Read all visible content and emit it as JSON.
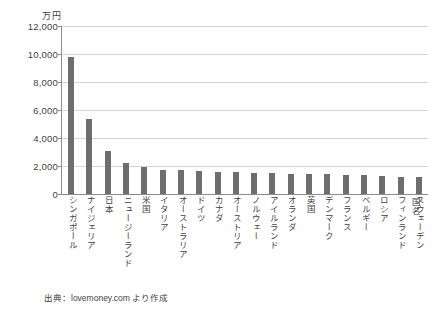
{
  "chart_data": {
    "type": "bar",
    "title": "",
    "subtitle": "",
    "xlabel": "国名",
    "ylabel": "万円",
    "ylim": [
      0,
      12000
    ],
    "ytick_labels": [
      "12,000",
      "10,000",
      "8,000",
      "6,000",
      "4,000",
      "2,000",
      "0"
    ],
    "ytick_values": [
      12000,
      10000,
      8000,
      6000,
      4000,
      2000,
      0
    ],
    "grid": true,
    "legend": "none",
    "bar_color": "#6e6e6e",
    "grid_color": "#d4d4d4",
    "axis_color": "#8c8c8c",
    "categories": [
      "シンガポール",
      "ナイジェリア",
      "日本",
      "ニュージーランド",
      "米国",
      "イタリア",
      "オーストラリア",
      "ドイツ",
      "カナダ",
      "オーストリア",
      "ノルウェー",
      "アイルランド",
      "オランダ",
      "英国",
      "デンマーク",
      "フランス",
      "ベルギー",
      "ロシア",
      "フィンランド",
      "スウェーデン"
    ],
    "values": [
      9800,
      5350,
      3100,
      2200,
      1950,
      1750,
      1700,
      1650,
      1600,
      1550,
      1500,
      1480,
      1450,
      1420,
      1400,
      1380,
      1350,
      1300,
      1250,
      1200
    ]
  },
  "annotations": {
    "source": "出典：lovemoney.com より作成"
  }
}
